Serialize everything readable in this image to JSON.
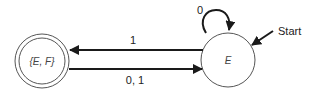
{
  "diagram": {
    "type": "finite-state-automaton",
    "states": [
      {
        "id": "EF",
        "label": "{E, F}",
        "accepting": true,
        "start": false
      },
      {
        "id": "E",
        "label": "E",
        "accepting": false,
        "start": true
      }
    ],
    "transitions": [
      {
        "from": "E",
        "to": "EF",
        "label": "1"
      },
      {
        "from": "EF",
        "to": "E",
        "label": "0, 1"
      },
      {
        "from": "E",
        "to": "E",
        "label": "0"
      }
    ],
    "start_label": "Start"
  },
  "colors": {
    "stroke": "#1a1a1a",
    "background": "#ffffff"
  }
}
